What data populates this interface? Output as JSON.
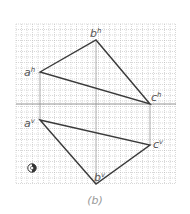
{
  "caption": "(b)",
  "grid": {
    "x0": 16,
    "y0": 24,
    "x1": 176,
    "y1": 184,
    "step": 5.5,
    "color": "#9a9a9a"
  },
  "fold_line": {
    "y": 104,
    "x0": 16,
    "x1": 176
  },
  "projectors": [
    {
      "x": 40,
      "y0": 72,
      "y1": 120
    },
    {
      "x": 96,
      "y0": 40,
      "y1": 184
    },
    {
      "x": 150,
      "y0": 104,
      "y1": 145
    }
  ],
  "triangles": {
    "horizontal": {
      "points": {
        "a": [
          40,
          72
        ],
        "b": [
          96,
          40
        ],
        "c": [
          150,
          104
        ]
      },
      "labels": {
        "a": "a",
        "b": "b",
        "c": "c",
        "sup": "h"
      }
    },
    "vertical": {
      "points": {
        "a": [
          40,
          120
        ],
        "b": [
          96,
          184
        ],
        "c": [
          150,
          145
        ]
      },
      "labels": {
        "a": "a",
        "b": "b",
        "c": "c",
        "sup": "v"
      }
    }
  },
  "label_text": {
    "ah": "a",
    "ah_sup": "h",
    "bh": "b",
    "bh_sup": "h",
    "ch": "c",
    "ch_sup": "h",
    "av": "a",
    "av_sup": "v",
    "bv": "b",
    "bv_sup": "v",
    "cv": "c",
    "cv_sup": "v"
  },
  "symbol": {
    "name": "first-angle-projection-symbol",
    "x": 32,
    "y": 168
  },
  "colors": {
    "line": "#3a3a3a",
    "label": "#555555",
    "grid": "#b0b0b0"
  }
}
